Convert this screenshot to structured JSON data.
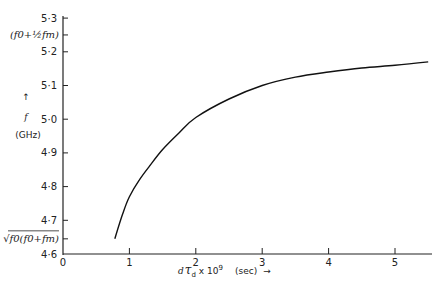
{
  "chart_data": {
    "type": "line",
    "title": "",
    "xlabel": "dτd x 10^9",
    "xlabel_parts": {
      "main": "d",
      "tau": "τ",
      "sub": "d",
      "mult": "x 10",
      "exp": "9",
      "unit": "(sec)",
      "arrow": "→"
    },
    "ylabel": "f (GHz)",
    "ylabel_parts": {
      "arrow": "↑",
      "symbol": "f",
      "unit": "(GHz)"
    },
    "xlim": [
      0,
      5.5
    ],
    "ylim": [
      4.6,
      5.3
    ],
    "grid": false,
    "legend": null,
    "x_ticks": [
      "0",
      "1",
      "2",
      "3",
      "4",
      "5"
    ],
    "y_ticks": [
      "4·6",
      "4·7",
      "4·8",
      "4·9",
      "5·0",
      "5·1",
      "5·2",
      "5·3"
    ],
    "y_annotations": [
      {
        "label": "(f0+½fm)",
        "value": 5.25
      },
      {
        "label": "√f0(f0+fm)",
        "value": 4.645
      }
    ],
    "series": [
      {
        "name": "f",
        "x": [
          0.78,
          0.9,
          1.0,
          1.15,
          1.3,
          1.5,
          1.75,
          2.0,
          2.5,
          3.0,
          3.5,
          4.0,
          4.5,
          5.0,
          5.5
        ],
        "values": [
          4.645,
          4.72,
          4.77,
          4.82,
          4.86,
          4.91,
          4.96,
          5.005,
          5.06,
          5.1,
          5.125,
          5.14,
          5.152,
          5.16,
          5.17
        ]
      }
    ]
  }
}
